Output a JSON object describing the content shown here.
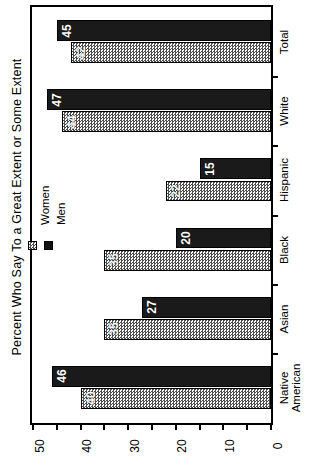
{
  "chart_data": {
    "type": "bar",
    "orientation": "horizontal-rotated",
    "title": "",
    "xlabel": "",
    "ylabel": "Percent Who Say To a Great Extent or Some Extent",
    "categories": [
      "Total",
      "White",
      "Hispanic",
      "Black",
      "Asian",
      "Native\nAmerican"
    ],
    "series": [
      {
        "name": "Women",
        "values": [
          42,
          44,
          22,
          35,
          35,
          40
        ],
        "color": "#4d4d4d",
        "pattern": "checker"
      },
      {
        "name": "Men",
        "values": [
          45,
          47,
          15,
          20,
          27,
          46
        ],
        "color": "#111111",
        "pattern": "solid"
      }
    ],
    "value_axis": {
      "min": 0,
      "max": 50,
      "reversed": true,
      "tick_step": 5,
      "label_step": 10,
      "labels": [
        "50",
        "40",
        "30",
        "20",
        "10",
        "0"
      ],
      "label_values": [
        50,
        40,
        30,
        20,
        10,
        0
      ],
      "tick_values": [
        50,
        45,
        40,
        35,
        30,
        25,
        20,
        15,
        10,
        5,
        0
      ]
    },
    "legend": {
      "position": "left-middle",
      "entries": [
        {
          "label": "Women"
        },
        {
          "label": "Men"
        }
      ]
    },
    "grid": false,
    "frame": true
  },
  "axis": {
    "title": "Percent Who Say To a Great Extent or Some Extent"
  }
}
